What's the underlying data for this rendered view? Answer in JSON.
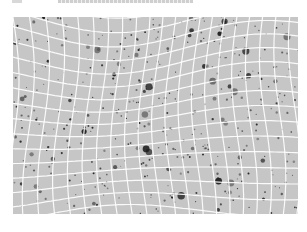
{
  "caption": {
    "text": "",
    "note": "cropped, illegible"
  },
  "figure": {
    "background_color": "#c6c6c6",
    "grid_color": "#ffffff",
    "object_color": "#1e1e1e",
    "grid_columns": 20,
    "grid_rows": 14
  }
}
